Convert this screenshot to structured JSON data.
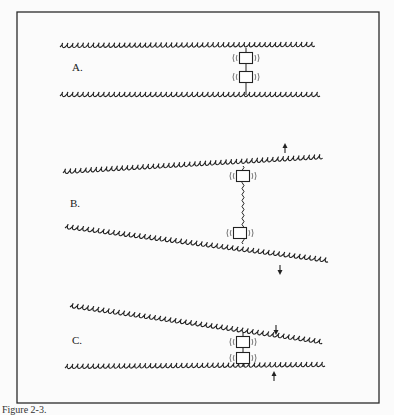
{
  "figure": {
    "frame": {
      "x": 17,
      "y": 12,
      "width": 362,
      "height": 391,
      "stroke": "#2a2a2a"
    },
    "caption": "Figure 2-3.",
    "ink_color": "#222222",
    "panels": [
      {
        "id": "A",
        "label": "A.",
        "label_pos": [
          72,
          71
        ],
        "description": "Two parallel filaments joined by a pair of linked boxes (bound state)",
        "filaments": [
          {
            "x1": 60,
            "y1": 47,
            "x2": 318,
            "y2": 46
          },
          {
            "x1": 60,
            "y1": 96,
            "x2": 320,
            "y2": 96
          }
        ],
        "boxes": [
          {
            "cx": 246,
            "cy": 58
          },
          {
            "cx": 246,
            "cy": 77
          }
        ],
        "link": {
          "x": 246,
          "y1": 48,
          "y2": 95,
          "wavy": false
        },
        "arrows": []
      },
      {
        "id": "B",
        "label": "B.",
        "label_pos": [
          70,
          207
        ],
        "description": "Filaments pulled apart; boxes separated by stretched wavy link",
        "filaments": [
          {
            "x1": 63,
            "y1": 173,
            "x2": 325,
            "y2": 158
          },
          {
            "x1": 65,
            "y1": 228,
            "x2": 330,
            "y2": 262
          }
        ],
        "boxes": [
          {
            "cx": 243,
            "cy": 176
          },
          {
            "cx": 240,
            "cy": 233
          }
        ],
        "link": {
          "x": 243,
          "y1": 166,
          "y2": 244,
          "wavy": true
        },
        "arrows": [
          {
            "x": 285,
            "y1": 153,
            "y2": 144,
            "direction": "up"
          },
          {
            "x": 280,
            "y1": 265,
            "y2": 274,
            "direction": "down"
          }
        ]
      },
      {
        "id": "C",
        "label": "C.",
        "label_pos": [
          72,
          344
        ],
        "description": "Filaments pushed together; boxes compressed",
        "filaments": [
          {
            "x1": 70,
            "y1": 307,
            "x2": 327,
            "y2": 344
          },
          {
            "x1": 65,
            "y1": 368,
            "x2": 325,
            "y2": 366
          }
        ],
        "boxes": [
          {
            "cx": 243,
            "cy": 342
          },
          {
            "cx": 243,
            "cy": 358
          }
        ],
        "link": {
          "x": 243,
          "y1": 333,
          "y2": 367,
          "wavy": false
        },
        "arrows": [
          {
            "x": 276,
            "y1": 325,
            "y2": 334,
            "direction": "down"
          },
          {
            "x": 274,
            "y1": 381,
            "y2": 372,
            "direction": "up"
          }
        ]
      }
    ]
  }
}
